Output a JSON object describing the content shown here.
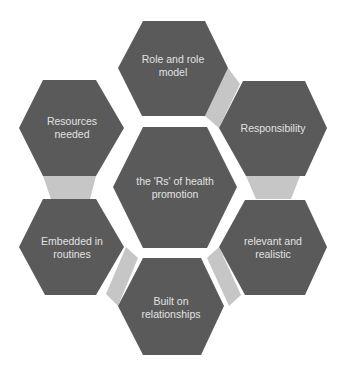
{
  "colors": {
    "hex_fill": "#5a5a5a",
    "connector_fill": "#c6c6c6",
    "text": "#e2e2e2",
    "background": "#ffffff"
  },
  "center": {
    "label": "the 'Rs' of health\npromotion"
  },
  "nodes": [
    {
      "id": "top",
      "label": "Role and role\nmodel"
    },
    {
      "id": "upper-right",
      "label": "Responsibility"
    },
    {
      "id": "lower-right",
      "label": "relevant and\nrealistic"
    },
    {
      "id": "bottom",
      "label": "Built on\nrelationships"
    },
    {
      "id": "lower-left",
      "label": "Embedded in\nroutines"
    },
    {
      "id": "upper-left",
      "label": "Resources\nneeded"
    }
  ]
}
